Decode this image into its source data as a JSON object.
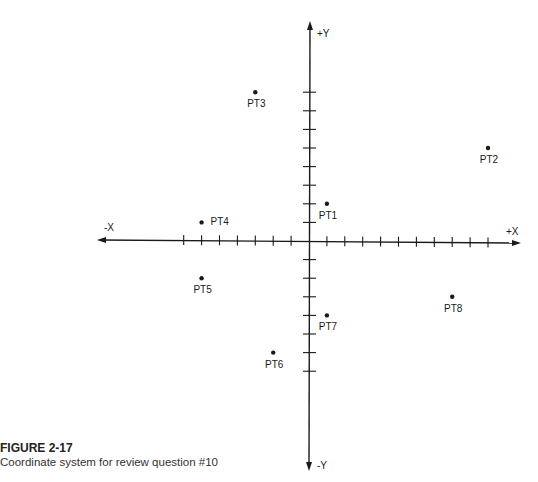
{
  "figure": {
    "number": "FIGURE 2-17",
    "caption": "Coordinate system for review question #10"
  },
  "axes": {
    "x_pos_label": "+X",
    "x_neg_label": "-X",
    "y_pos_label": "+Y",
    "y_neg_label": "-Y"
  },
  "chart_data": {
    "type": "scatter",
    "title": "Coordinate system for review question #10",
    "xlabel": "X",
    "ylabel": "Y",
    "x_ticks": [
      -7,
      -6,
      -5,
      -4,
      -3,
      -2,
      -1,
      1,
      2,
      3,
      4,
      5,
      6,
      7,
      8,
      9,
      10
    ],
    "y_ticks": [
      -7,
      -6,
      -5,
      -4,
      -3,
      -2,
      -1,
      1,
      2,
      3,
      4,
      5,
      6,
      7,
      8
    ],
    "xlim": [
      -11,
      11
    ],
    "ylim": [
      -11,
      11
    ],
    "grid": false,
    "points": [
      {
        "label": "PT1",
        "x": 1,
        "y": 2
      },
      {
        "label": "PT2",
        "x": 10,
        "y": 5
      },
      {
        "label": "PT3",
        "x": -3,
        "y": 8
      },
      {
        "label": "PT4",
        "x": -6,
        "y": 1
      },
      {
        "label": "PT5",
        "x": -6,
        "y": -2
      },
      {
        "label": "PT6",
        "x": -2,
        "y": -6
      },
      {
        "label": "PT7",
        "x": 1,
        "y": -4
      },
      {
        "label": "PT8",
        "x": 8,
        "y": -3
      }
    ]
  }
}
